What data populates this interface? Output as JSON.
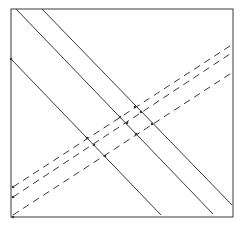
{
  "diagram": {
    "width": 243,
    "height": 225,
    "stroke_color": "#3a3a3a",
    "background": "#ffffff",
    "frame": {
      "x1": 11,
      "y1": 9,
      "x2": 233,
      "y2": 217
    },
    "solid_lines": [
      {
        "x1": 16,
        "y1": 9,
        "x2": 213,
        "y2": 214
      },
      {
        "x1": 42,
        "y1": 9,
        "x2": 232,
        "y2": 205
      },
      {
        "x1": 11,
        "y1": 59,
        "x2": 161,
        "y2": 215
      }
    ],
    "dashed_lines": [
      {
        "x1": 13,
        "y1": 187,
        "x2": 233,
        "y2": 44
      },
      {
        "x1": 13,
        "y1": 197,
        "x2": 233,
        "y2": 52
      },
      {
        "x1": 13,
        "y1": 215,
        "x2": 233,
        "y2": 72
      }
    ],
    "points": [
      {
        "x": 135,
        "y": 107
      },
      {
        "x": 141,
        "y": 112
      },
      {
        "x": 120,
        "y": 117
      },
      {
        "x": 127,
        "y": 123
      },
      {
        "x": 152,
        "y": 124
      },
      {
        "x": 136,
        "y": 134
      },
      {
        "x": 87,
        "y": 138
      },
      {
        "x": 94,
        "y": 145
      },
      {
        "x": 105,
        "y": 156
      },
      {
        "x": 11,
        "y": 59
      },
      {
        "x": 13,
        "y": 187
      },
      {
        "x": 13,
        "y": 197
      },
      {
        "x": 13,
        "y": 217
      }
    ]
  }
}
